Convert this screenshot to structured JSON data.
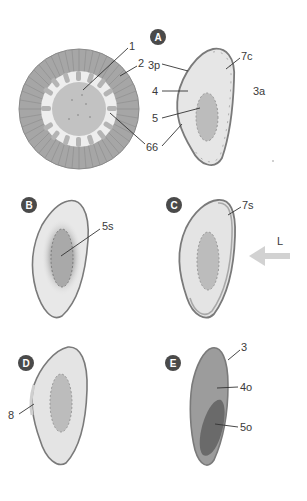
{
  "diagram": {
    "type": "biology-cross-sections",
    "colors": {
      "outline": "#7a7a7a",
      "light_fill": "#e4e4e4",
      "core_fill": "#b8b8b8",
      "badge": "#4a4a4a",
      "arrow": "#cfcfcf",
      "dark_fill": "#9a9a9a",
      "darker_fill": "#6a6a6a",
      "ring_fill": "#a8a8a8",
      "text": "#3a3a3a"
    },
    "overview": {
      "labels": {
        "l1": "1",
        "l2": "2",
        "l6": "6"
      }
    },
    "panels": {
      "A": {
        "badge": "A",
        "labels": {
          "l3p": "3p",
          "l4": "4",
          "l5": "5",
          "l6": "6",
          "l7c": "7c",
          "l3a": "3a"
        }
      },
      "B": {
        "badge": "B",
        "labels": {
          "l5s": "5s"
        }
      },
      "C": {
        "badge": "C",
        "labels": {
          "l7s": "7s",
          "lL": "L"
        }
      },
      "D": {
        "badge": "D",
        "labels": {
          "l8": "8"
        }
      },
      "E": {
        "badge": "E",
        "labels": {
          "l3": "3",
          "l4o": "4o",
          "l5o": "5o"
        }
      }
    }
  }
}
